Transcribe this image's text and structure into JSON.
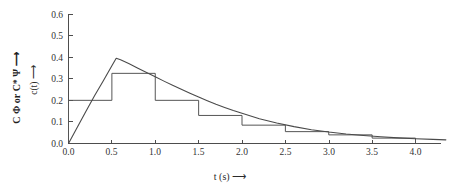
{
  "chart_data": {
    "type": "line",
    "title": "",
    "subtitle": "",
    "xlabel": "t (s) ⟶",
    "ylabel": "c(t) ⟶",
    "ylabel_outer": "C Φ or C* Ψ ⟶",
    "xlim": [
      0.0,
      4.35
    ],
    "ylim": [
      0.0,
      0.6
    ],
    "grid": false,
    "legend": null,
    "xticks": [
      0.0,
      0.5,
      1.0,
      1.5,
      2.0,
      2.5,
      3.0,
      3.5,
      4.0
    ],
    "xtick_labels": [
      "0.0",
      "0.5",
      "1.0",
      "1.5",
      "2.0",
      "2.5",
      "3.0",
      "3.5",
      "4.0"
    ],
    "yticks": [
      0.0,
      0.1,
      0.2,
      0.3,
      0.4,
      0.5,
      0.6
    ],
    "ytick_labels": [
      "0.0",
      "0.1",
      "0.2",
      "0.3",
      "0.4",
      "0.5",
      "0.6"
    ],
    "series": [
      {
        "name": "step",
        "type": "step",
        "bin_edges": [
          0.0,
          0.5,
          1.0,
          1.5,
          2.0,
          2.5,
          3.0,
          3.5,
          4.0
        ],
        "values": [
          0.2,
          0.325,
          0.2,
          0.13,
          0.085,
          0.055,
          0.04,
          0.025
        ]
      },
      {
        "name": "curve",
        "type": "line",
        "x": [
          0.0,
          0.1,
          0.2,
          0.3,
          0.4,
          0.5,
          0.55,
          0.6,
          0.7,
          0.8,
          0.9,
          1.0,
          1.1,
          1.2,
          1.3,
          1.4,
          1.5,
          1.6,
          1.7,
          1.8,
          1.9,
          2.0,
          2.2,
          2.4,
          2.6,
          2.8,
          3.0,
          3.2,
          3.4,
          3.6,
          3.8,
          4.0,
          4.2,
          4.35
        ],
        "y": [
          0.0,
          0.074,
          0.148,
          0.221,
          0.29,
          0.36,
          0.395,
          0.388,
          0.369,
          0.349,
          0.329,
          0.309,
          0.289,
          0.27,
          0.251,
          0.233,
          0.215,
          0.198,
          0.182,
          0.167,
          0.153,
          0.14,
          0.115,
          0.095,
          0.078,
          0.064,
          0.053,
          0.044,
          0.037,
          0.031,
          0.026,
          0.022,
          0.019,
          0.017
        ]
      }
    ],
    "colors": {
      "axis": "#4d4d4d",
      "step_line": "#555555",
      "curve_line": "#4a4a4a",
      "background": "#ffffff",
      "text": "#2b2b2b"
    },
    "annotations": []
  }
}
